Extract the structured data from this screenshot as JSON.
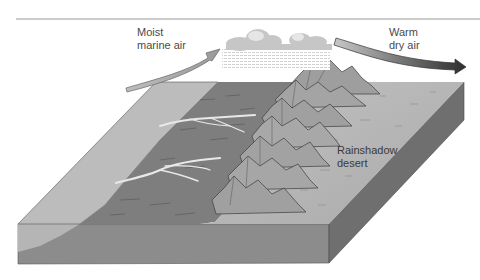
{
  "figure": {
    "labels": {
      "moist_air": [
        "Moist",
        "marine air"
      ],
      "warm_air": [
        "Warm",
        "dry air"
      ],
      "desert": [
        "Rainshadow",
        "desert"
      ]
    },
    "elements": [
      "moist marine air arrow",
      "rain clouds over mountains",
      "mountain range",
      "rivers flowing to coast",
      "ocean",
      "rainshadow desert",
      "warm dry air arrow"
    ],
    "colors": {
      "ocean": "#b9b9b9",
      "windward_land": "#7e7e7e",
      "desert": "#b4b4b4",
      "block_front": "#8a8a8a",
      "block_side": "#6e6e6e",
      "moist_arrow": "#b0b0b0",
      "dry_arrow": "#333333",
      "rule": "#999999"
    }
  }
}
